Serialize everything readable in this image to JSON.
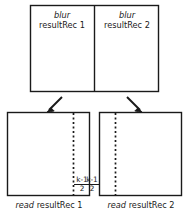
{
  "diagram": {
    "stroke_color": "#1a1a1a",
    "background_color": "#ffffff",
    "top_group": {
      "name": "blur-write-rectangles",
      "cells": [
        {
          "operation": "blur",
          "buffer": "resultRec 1"
        },
        {
          "operation": "blur",
          "buffer": "resultRec 2"
        }
      ]
    },
    "arrows": [
      {
        "name": "arrow-left",
        "direction": "down-left"
      },
      {
        "name": "arrow-right",
        "direction": "down-right"
      }
    ],
    "bottom_group": {
      "name": "read-rectangles",
      "cells": [
        {
          "operation": "read",
          "buffer": "resultRec 1",
          "caption": "read resultRec 1",
          "margin_label": {
            "numerator": "k-1",
            "denominator": "2"
          },
          "dashed_line_side": "right"
        },
        {
          "operation": "read",
          "buffer": "resultRec 2",
          "caption": "read resultRec 2",
          "margin_label": {
            "numerator": "k-1",
            "denominator": "2"
          },
          "dashed_line_side": "left"
        }
      ]
    }
  }
}
